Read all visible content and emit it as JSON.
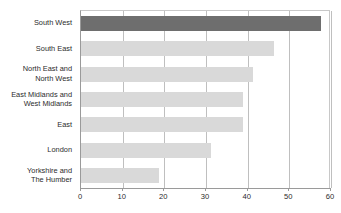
{
  "chart_data": {
    "type": "bar",
    "orientation": "horizontal",
    "title": "",
    "xlabel": "",
    "ylabel": "",
    "xlim": [
      0,
      60
    ],
    "xticks": [
      0,
      10,
      20,
      30,
      40,
      50,
      60
    ],
    "xtick_labels": [
      "0",
      "10",
      "20",
      "30",
      "40",
      "50",
      "60"
    ],
    "grid": true,
    "legend": "none",
    "categories": [
      "South West",
      "South East",
      "North East and North West",
      "East Midlands and West Midlands",
      "East",
      "London",
      "Yorkshire and The Humber"
    ],
    "values": [
      57.6,
      46.3,
      41.2,
      38.8,
      38.8,
      31.1,
      18.8
    ],
    "bars": [
      {
        "label_lines": [
          "South West"
        ],
        "value": 57.6,
        "highlight": true
      },
      {
        "label_lines": [
          "South East"
        ],
        "value": 46.3,
        "highlight": false
      },
      {
        "label_lines": [
          "North East and",
          "North West"
        ],
        "value": 41.2,
        "highlight": false
      },
      {
        "label_lines": [
          "East Midlands and",
          "West Midlands"
        ],
        "value": 38.8,
        "highlight": false
      },
      {
        "label_lines": [
          "East"
        ],
        "value": 38.8,
        "highlight": false
      },
      {
        "label_lines": [
          "London"
        ],
        "value": 31.1,
        "highlight": false
      },
      {
        "label_lines": [
          "Yorkshire and",
          "The Humber"
        ],
        "value": 18.8,
        "highlight": false
      }
    ],
    "colors": {
      "bar_default": "#d9d9d9",
      "bar_highlight": "#6e6e6e",
      "gridline": "#bfbfbf",
      "axis": "#9a9a9a",
      "plot_border": "#c8c8c8",
      "text": "#2b2b2b",
      "background": "#ffffff"
    }
  }
}
